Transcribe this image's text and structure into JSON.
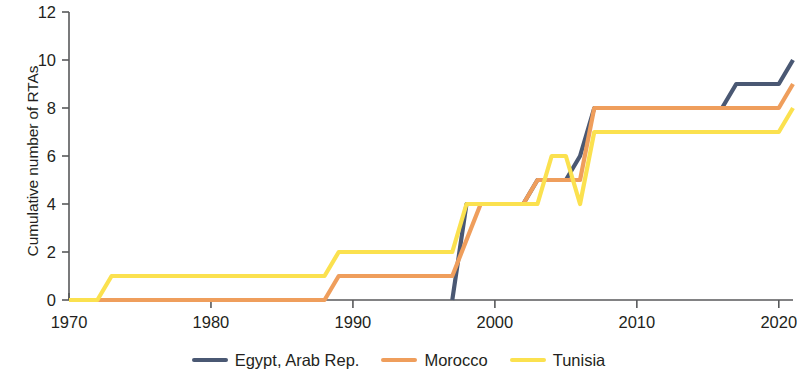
{
  "chart_data": {
    "type": "line",
    "title": "",
    "xlabel": "",
    "ylabel": "Cumulative number of RTAs",
    "xlim": [
      1970,
      2021
    ],
    "ylim": [
      0,
      12
    ],
    "xticks": [
      1970,
      1980,
      1990,
      2000,
      2010,
      2020
    ],
    "yticks": [
      0,
      2,
      4,
      6,
      8,
      10,
      12
    ],
    "grid": false,
    "legend_position": "bottom",
    "series": [
      {
        "name": "Egypt, Arab Rep.",
        "color": "#4a5873",
        "x": [
          1997,
          1998,
          2002,
          2003,
          2005,
          2006,
          2007,
          2016,
          2017,
          2020,
          2021
        ],
        "y": [
          0,
          4,
          4,
          5,
          5,
          6,
          8,
          8,
          9,
          9,
          10
        ]
      },
      {
        "name": "Morocco",
        "color": "#ef9e5c",
        "x": [
          1970,
          1988,
          1989,
          1997,
          1999,
          2002,
          2003,
          2006,
          2007,
          2020,
          2021
        ],
        "y": [
          0,
          0,
          1,
          1,
          4,
          4,
          5,
          5,
          8,
          8,
          9
        ]
      },
      {
        "name": "Tunisia",
        "color": "#fbe14f",
        "x": [
          1970,
          1972,
          1973,
          1988,
          1989,
          1997,
          1998,
          2002,
          2003,
          2004,
          2005,
          2006,
          2007,
          2020,
          2021
        ],
        "y": [
          0,
          0,
          1,
          1,
          2,
          2,
          4,
          4,
          4,
          6,
          6,
          4,
          7,
          7,
          8
        ]
      }
    ]
  },
  "axis": {
    "y_title": "Cumulative number of RTAs"
  },
  "legend": {
    "items": [
      {
        "label": "Egypt, Arab Rep.",
        "color": "#4a5873"
      },
      {
        "label": "Morocco",
        "color": "#ef9e5c"
      },
      {
        "label": "Tunisia",
        "color": "#fbe14f"
      }
    ]
  }
}
